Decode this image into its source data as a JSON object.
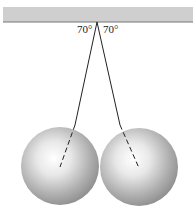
{
  "diagram": {
    "angle_left": "70°",
    "angle_right": "70°"
  }
}
